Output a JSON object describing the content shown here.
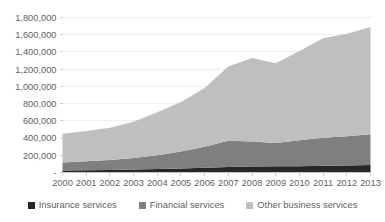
{
  "chart_data": {
    "type": "area",
    "stacked": true,
    "title": "",
    "subtitle": "",
    "xlabel": "",
    "ylabel": "",
    "categories": [
      "2000",
      "2001",
      "2002",
      "2003",
      "2004",
      "2005",
      "2006",
      "2007",
      "2008",
      "2009",
      "2010",
      "2011",
      "2012",
      "2013"
    ],
    "x": [
      2000,
      2001,
      2002,
      2003,
      2004,
      2005,
      2006,
      2007,
      2008,
      2009,
      2010,
      2011,
      2012,
      2013
    ],
    "series": [
      {
        "name": "Insurance services",
        "color": "#262626",
        "values": [
          23000,
          26000,
          30000,
          34000,
          40000,
          47000,
          55000,
          63000,
          70000,
          72000,
          74000,
          78000,
          82000,
          86000
        ]
      },
      {
        "name": "Financial services",
        "color": "#7f7f7f",
        "values": [
          93000,
          104000,
          116000,
          133000,
          160000,
          196000,
          245000,
          305000,
          290000,
          272000,
          300000,
          325000,
          340000,
          358000
        ]
      },
      {
        "name": "Other business services",
        "color": "#bfbfbf",
        "values": [
          334000,
          352000,
          374000,
          423000,
          500000,
          577000,
          680000,
          862000,
          970000,
          926000,
          1036000,
          1157000,
          1188000,
          1246000
        ]
      }
    ],
    "totals": [
      450000,
      482000,
      520000,
      590000,
      700000,
      820000,
      980000,
      1230000,
      1330000,
      1270000,
      1410000,
      1560000,
      1610000,
      1690000
    ],
    "ylim": [
      0,
      1800000
    ],
    "ytick_values": [
      0,
      200000,
      400000,
      600000,
      800000,
      1000000,
      1200000,
      1400000,
      1600000,
      1800000
    ],
    "ytick_labels": [
      "-",
      "200,000",
      "400,000",
      "600,000",
      "800,000",
      "1,000,000",
      "1,200,000",
      "1,400,000",
      "1,600,000",
      "1,800,000"
    ],
    "grid": true,
    "legend_position": "bottom",
    "legend": [
      {
        "label": "Insurance services",
        "color": "#262626"
      },
      {
        "label": "Financial services",
        "color": "#7f7f7f"
      },
      {
        "label": "Other business services",
        "color": "#bfbfbf"
      }
    ]
  },
  "colors": {
    "insurance": "#262626",
    "financial": "#7f7f7f",
    "other_business": "#bfbfbf",
    "gridline": "#e8e8e8",
    "axis": "#c9c9c9",
    "text": "#5f5f5f",
    "background": "#ffffff"
  }
}
